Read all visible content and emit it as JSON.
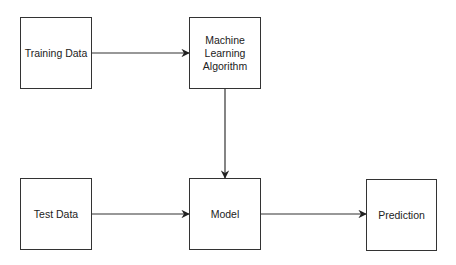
{
  "colors": {
    "stroke": "#333333",
    "text": "#222222",
    "background": "#ffffff"
  },
  "nodes": [
    {
      "id": "training",
      "label": "Training Data",
      "x": 20,
      "y": 17,
      "w": 72,
      "h": 72
    },
    {
      "id": "algorithm",
      "label": "Machine\nLearning\nAlgorithm",
      "x": 189,
      "y": 17,
      "w": 72,
      "h": 72
    },
    {
      "id": "test",
      "label": "Test Data",
      "x": 20,
      "y": 178,
      "w": 72,
      "h": 72
    },
    {
      "id": "model",
      "label": "Model",
      "x": 189,
      "y": 178,
      "w": 72,
      "h": 72
    },
    {
      "id": "prediction",
      "label": "Prediction",
      "x": 366,
      "y": 179,
      "w": 71,
      "h": 72
    }
  ],
  "edges": [
    {
      "from": "training",
      "to": "algorithm"
    },
    {
      "from": "algorithm",
      "to": "model"
    },
    {
      "from": "test",
      "to": "model"
    },
    {
      "from": "model",
      "to": "prediction"
    }
  ]
}
